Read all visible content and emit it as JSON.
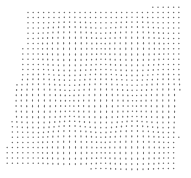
{
  "image": {
    "width": 191,
    "height": 178,
    "background": "#ffffff",
    "description": "dot grid with hexagonal moire distortion"
  },
  "pattern": {
    "dot_color": "#6e6e6e",
    "dot_spacing": 5.2,
    "dot_radius": 0.75,
    "region": {
      "top_left": [
        28,
        12
      ],
      "top_right": [
        182,
        6
      ],
      "bottom_right": [
        178,
        170
      ],
      "bottom_left": [
        4,
        168
      ]
    },
    "hex_cells": [
      {
        "cx": 70,
        "cy": 48,
        "r": 34
      },
      {
        "cx": 134,
        "cy": 48,
        "r": 34
      },
      {
        "cx": 38,
        "cy": 104,
        "r": 34
      },
      {
        "cx": 102,
        "cy": 104,
        "r": 34
      },
      {
        "cx": 166,
        "cy": 104,
        "r": 34
      },
      {
        "cx": 70,
        "cy": 150,
        "r": 34
      },
      {
        "cx": 134,
        "cy": 150,
        "r": 34
      }
    ],
    "distortion_strength": 1.6
  }
}
